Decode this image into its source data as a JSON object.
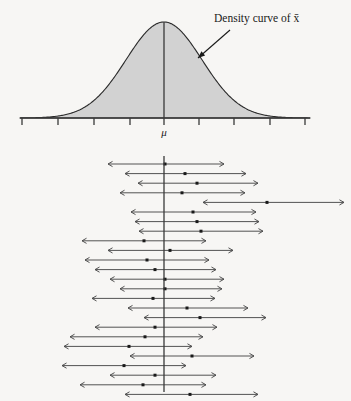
{
  "figure": {
    "background_color": "#f7f6f4"
  },
  "top_panel": {
    "annotation_label": "Density curve of x̄",
    "mu_label": "μ",
    "curve": {
      "type": "normal-density",
      "fill_color": "#d2d2d2",
      "stroke_color": "#2a2a2a",
      "center_x": 164,
      "baseline_y": 118,
      "peak_y": 22,
      "sigma_px": 38
    },
    "axis": {
      "y": 118,
      "x_start": 20,
      "x_end": 310,
      "tick_count": 9,
      "tick_positions": [
        22,
        58,
        94,
        130,
        164,
        199,
        234,
        270,
        305
      ],
      "tick_length": 7,
      "mu_tick_index": 4
    },
    "pointer": {
      "from_x": 230,
      "from_y": 30,
      "to_x": 198,
      "to_y": 58
    }
  },
  "bottom_panel": {
    "description": "Twenty-five confidence intervals from repeated samples; one fails to capture mu",
    "center_line": {
      "x": 164,
      "y_top": 156,
      "y_bottom": 392,
      "color": "#3a3a3a"
    },
    "row_spacing": 9.6,
    "first_row_y": 164,
    "interval_color": "#4a4a4a",
    "dot_color": "#1a1a1a",
    "intervals": [
      {
        "row": 1,
        "left": 108,
        "center": 165,
        "right": 224,
        "captures_mu": true
      },
      {
        "row": 2,
        "left": 125,
        "center": 185,
        "right": 246,
        "captures_mu": true
      },
      {
        "row": 3,
        "left": 138,
        "center": 197,
        "right": 258,
        "captures_mu": true
      },
      {
        "row": 4,
        "left": 120,
        "center": 182,
        "right": 245,
        "captures_mu": true
      },
      {
        "row": 5,
        "left": 203,
        "center": 267,
        "right": 344,
        "captures_mu": false
      },
      {
        "row": 6,
        "left": 131,
        "center": 193,
        "right": 256,
        "captures_mu": true
      },
      {
        "row": 7,
        "left": 135,
        "center": 197,
        "right": 259,
        "captures_mu": true
      },
      {
        "row": 8,
        "left": 139,
        "center": 201,
        "right": 263,
        "captures_mu": true
      },
      {
        "row": 9,
        "left": 82,
        "center": 144,
        "right": 206,
        "captures_mu": true
      },
      {
        "row": 10,
        "left": 108,
        "center": 170,
        "right": 233,
        "captures_mu": true
      },
      {
        "row": 11,
        "left": 85,
        "center": 147,
        "right": 209,
        "captures_mu": true
      },
      {
        "row": 12,
        "left": 95,
        "center": 155,
        "right": 216,
        "captures_mu": true
      },
      {
        "row": 13,
        "left": 110,
        "center": 165,
        "right": 224,
        "captures_mu": true
      },
      {
        "row": 14,
        "left": 120,
        "center": 165,
        "right": 222,
        "captures_mu": true
      },
      {
        "row": 15,
        "left": 92,
        "center": 153,
        "right": 215,
        "captures_mu": true
      },
      {
        "row": 16,
        "left": 128,
        "center": 187,
        "right": 248,
        "captures_mu": true
      },
      {
        "row": 17,
        "left": 144,
        "center": 200,
        "right": 266,
        "captures_mu": true
      },
      {
        "row": 18,
        "left": 95,
        "center": 155,
        "right": 217,
        "captures_mu": true
      },
      {
        "row": 19,
        "left": 70,
        "center": 145,
        "right": 203,
        "captures_mu": true
      },
      {
        "row": 20,
        "left": 64,
        "center": 129,
        "right": 192,
        "captures_mu": true
      },
      {
        "row": 21,
        "left": 130,
        "center": 192,
        "right": 254,
        "captures_mu": true
      },
      {
        "row": 22,
        "left": 62,
        "center": 124,
        "right": 186,
        "captures_mu": true
      },
      {
        "row": 23,
        "left": 110,
        "center": 155,
        "right": 216,
        "captures_mu": true
      },
      {
        "row": 24,
        "left": 80,
        "center": 143,
        "right": 206,
        "captures_mu": true
      },
      {
        "row": 25,
        "left": 125,
        "center": 190,
        "right": 258,
        "captures_mu": true
      }
    ]
  }
}
